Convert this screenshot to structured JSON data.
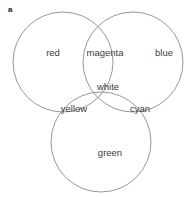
{
  "figure": {
    "panel_label": "a",
    "background_color": "#ffffff",
    "stroke_color": "#8c8c8c",
    "text_color": "#3d3d3d",
    "width": 193,
    "height": 197
  },
  "diagram": {
    "type": "venn-3-circle",
    "circles": [
      {
        "name": "red-circle",
        "cx": 63,
        "cy": 62,
        "r": 50
      },
      {
        "name": "blue-circle",
        "cx": 133,
        "cy": 62,
        "r": 50
      },
      {
        "name": "green-circle",
        "cx": 101,
        "cy": 142,
        "r": 50
      }
    ],
    "regions": [
      {
        "id": "red",
        "label": "red",
        "x": 53,
        "y": 53
      },
      {
        "id": "magenta",
        "label": "magenta",
        "x": 105,
        "y": 53
      },
      {
        "id": "blue",
        "label": "blue",
        "x": 164,
        "y": 53
      },
      {
        "id": "white",
        "label": "white",
        "x": 108,
        "y": 87
      },
      {
        "id": "yellow",
        "label": "yellow",
        "x": 74,
        "y": 109
      },
      {
        "id": "cyan",
        "label": "cyan",
        "x": 140,
        "y": 109
      },
      {
        "id": "green",
        "label": "green",
        "x": 110,
        "y": 153
      }
    ]
  }
}
